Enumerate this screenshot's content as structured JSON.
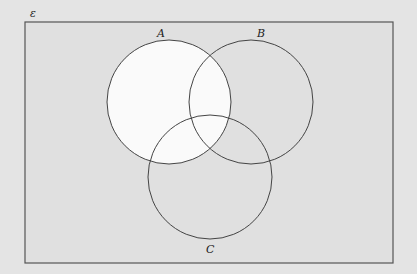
{
  "diagram": {
    "type": "venn",
    "universal_label": "ε",
    "sets": [
      {
        "label": "A",
        "shaded": true
      },
      {
        "label": "B",
        "shaded": false
      },
      {
        "label": "C",
        "shaded": false
      }
    ],
    "shaded_region": "A",
    "colors": {
      "background": "#e4e4e4",
      "shaded": "#fafafa",
      "stroke": "#444444"
    }
  }
}
